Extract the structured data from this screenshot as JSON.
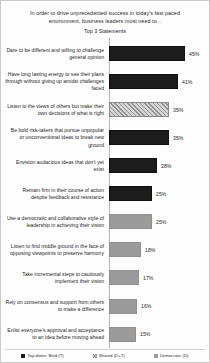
{
  "chart_data": {
    "type": "bar",
    "orientation": "horizontal",
    "title": "In order to drive unprecedented success in today's fast paced environment, business leaders most need to...",
    "subtitle": "Top 3 Statements",
    "xlabel": "",
    "ylabel": "",
    "xlim": [
      0,
      45
    ],
    "grid": false,
    "legend_position": "bottom",
    "categories": [
      "Dare to be different and willing to challenge  general opinion",
      "Have long lasting energy to see their plans through without giving up amidst challenges faced",
      "Listen to the views of others but make their own decisions of what is right",
      "Be bold risk-takers  that pursue unpopular or unconventional ideas to break new ground",
      "Envision audacious ideas that don't yet exist",
      "Remain firm in their course of action despite feedback and resistance",
      "Use a democratic and collaborative style of leadership  in achieving their vision",
      "Listen to find middle ground in the face of opposing viewpoints  to preserve harmony",
      "Take incremental steps to cautiously implement their vision",
      "Rely on consensus and support from others to make a difference",
      "Enlist everyone's approval and acceptance to an idea before moving ahead"
    ],
    "values": [
      45,
      41,
      35,
      35,
      28,
      25,
      25,
      18,
      17,
      16,
      15
    ],
    "value_labels": [
      "45%",
      "41%",
      "35%",
      "35%",
      "28%",
      "25%",
      "25%",
      "18%",
      "17%",
      "16%",
      "15%"
    ],
    "series_key": [
      "topdown",
      "topdown",
      "shared",
      "topdown",
      "topdown",
      "topdown",
      "democratic",
      "democratic",
      "democratic",
      "democratic",
      "democratic"
    ],
    "legend": [
      {
        "key": "topdown",
        "label": "Top-down: Bold (T)",
        "color": "#1c1c1c"
      },
      {
        "key": "shared",
        "label": "Shared (D+T)",
        "color": "#b3b3b3"
      },
      {
        "key": "democratic",
        "label": "Democratic (D)",
        "color": "#9b9b9b"
      }
    ]
  }
}
